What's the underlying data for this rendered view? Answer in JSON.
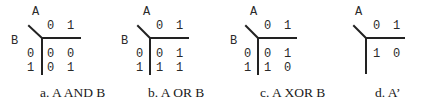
{
  "figure": {
    "panels": [
      {
        "id": "a",
        "var_col": "A",
        "var_row": "B",
        "col_headers": [
          "0",
          "1"
        ],
        "row_headers": [
          "0",
          "1"
        ],
        "cells": [
          [
            "0",
            "0"
          ],
          [
            "0",
            "1"
          ]
        ],
        "caption": "a. A AND B"
      },
      {
        "id": "b",
        "var_col": "A",
        "var_row": "B",
        "col_headers": [
          "0",
          "1"
        ],
        "row_headers": [
          "0",
          "1"
        ],
        "cells": [
          [
            "0",
            "1"
          ],
          [
            "1",
            "1"
          ]
        ],
        "caption": "b. A OR B"
      },
      {
        "id": "c",
        "var_col": "A",
        "var_row": "B",
        "col_headers": [
          "0",
          "1"
        ],
        "row_headers": [
          "0",
          "1"
        ],
        "cells": [
          [
            "0",
            "1"
          ],
          [
            "1",
            "0"
          ]
        ],
        "caption": "c. A XOR B"
      },
      {
        "id": "d",
        "var_col": "A",
        "col_headers": [
          "0",
          "1"
        ],
        "cells": [
          [
            "1",
            "0"
          ]
        ],
        "caption": "d. A’"
      }
    ]
  }
}
